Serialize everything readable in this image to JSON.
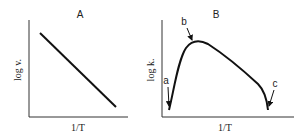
{
  "panels": [
    {
      "id": "A",
      "title": "A",
      "ylabel": "log v.",
      "xlabel": "1/T"
    },
    {
      "id": "B",
      "title": "B",
      "ylabel": "log k.",
      "xlabel": "1/T",
      "annotations": [
        {
          "label": "a",
          "meaning": "left minimum"
        },
        {
          "label": "b",
          "meaning": "maximum"
        },
        {
          "label": "c",
          "meaning": "right minimum"
        }
      ]
    }
  ],
  "colors": {
    "line": "#111111",
    "axis": "#333333",
    "background": "#ffffff"
  }
}
